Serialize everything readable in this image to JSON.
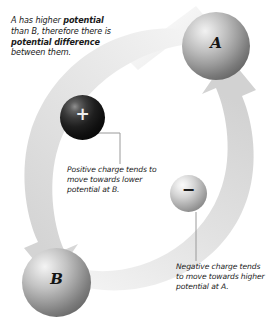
{
  "figure": {
    "background_color": "#ffffff"
  },
  "captions": {
    "intro": {
      "line1_plain": "A has higher ",
      "line1_bold": "potential",
      "line2_plain": " than B, therefore there is ",
      "line2_bold": "potential difference",
      "line3_plain": " between them.",
      "full_text": "A has higher potential than B, therefore there is potential difference between them."
    },
    "positive": {
      "text": "Positive charge tends to move towards lower potential at B."
    },
    "negative": {
      "text": "Negative charge tends to move towards higher potential at A."
    }
  },
  "nodes": {
    "a": {
      "label": "A",
      "role": "higher-potential-body",
      "fill_light": "#f2f2f2",
      "fill_dark": "#636363"
    },
    "b": {
      "label": "B",
      "role": "lower-potential-body",
      "fill_light": "#f4f4f4",
      "fill_dark": "#656565"
    }
  },
  "charges": {
    "positive": {
      "sign": "+",
      "color": "#0d0d0d",
      "sign_color": "#efefef",
      "description": "positive charge"
    },
    "negative": {
      "sign": "−",
      "color": "#cfcfcf",
      "sign_color": "#1c1c1c",
      "description": "negative charge"
    }
  },
  "arrows": {
    "to_a": {
      "from": "B",
      "to": "A",
      "direction": "up-right",
      "color": "#dcdcdc",
      "description": "curved arrow sweeping from B up the right side into A"
    },
    "to_b": {
      "from": "A",
      "to": "B",
      "direction": "down-left",
      "color": "#dcdcdc",
      "description": "curved arrow sweeping from A down the left side into B"
    }
  },
  "leader_lines": {
    "positive": "elbow leader from positive charge to its caption",
    "negative": "vertical leader from negative charge to its caption",
    "color": "#9a9a9a"
  }
}
